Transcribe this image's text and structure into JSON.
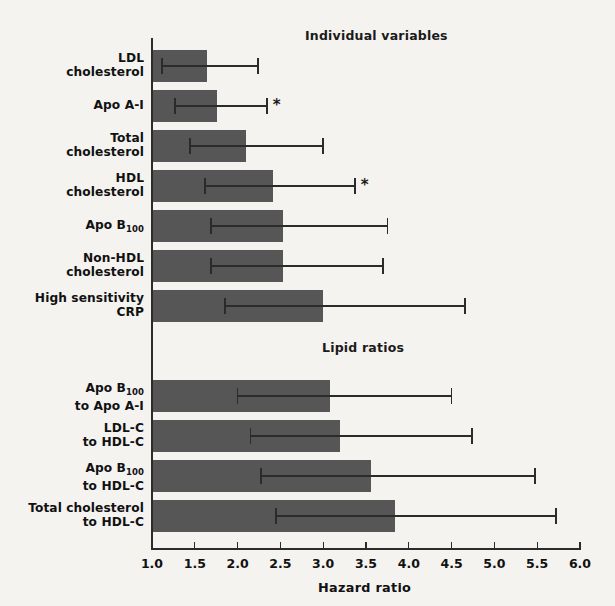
{
  "figure": {
    "section_titles": {
      "individual": "Individual variables",
      "ratios": "Lipid  ratios"
    },
    "axis_title": "Hazard ratio",
    "footnote_marker": "*",
    "colors": {
      "bar_fill": "#565656",
      "axis": "#2b2b2b",
      "background": "#f4f3f0",
      "text": "#111111"
    }
  },
  "chart_data": {
    "type": "bar",
    "orientation": "horizontal",
    "title": "",
    "xlabel": "Hazard ratio",
    "ylabel": "",
    "xlim": [
      1.0,
      6.0
    ],
    "xticks": [
      1.0,
      1.5,
      2.0,
      2.5,
      3.0,
      3.5,
      4.0,
      4.5,
      5.0,
      5.5,
      6.0
    ],
    "xticklabels": [
      "1.0",
      "1.5",
      "2.0",
      "2.5",
      "3.0",
      "3.5",
      "4.0",
      "4.5",
      "5.0",
      "5.5",
      "6.0"
    ],
    "grid": false,
    "legend": null,
    "error_bars": "95% confidence interval",
    "groups": [
      {
        "name": "Individual variables",
        "categories": [
          {
            "label": "LDL cholesterol",
            "label_lines": [
              "LDL",
              "cholesterol"
            ],
            "value": 1.64,
            "ci_low": 1.12,
            "ci_high": 2.24,
            "significant_marker": ""
          },
          {
            "label": "Apo A-I",
            "label_lines": [
              "Apo A-I"
            ],
            "value": 1.76,
            "ci_low": 1.27,
            "ci_high": 2.34,
            "significant_marker": "*"
          },
          {
            "label": "Total cholesterol",
            "label_lines": [
              "Total",
              "cholesterol"
            ],
            "value": 2.1,
            "ci_low": 1.44,
            "ci_high": 3.0,
            "significant_marker": ""
          },
          {
            "label": "HDL cholesterol",
            "label_lines": [
              "HDL",
              "cholesterol"
            ],
            "value": 2.41,
            "ci_low": 1.62,
            "ci_high": 3.37,
            "significant_marker": "*"
          },
          {
            "label": "Apo B100",
            "label_lines": [
              "Apo B<sub>100</sub>"
            ],
            "value": 2.53,
            "ci_low": 1.69,
            "ci_high": 3.75,
            "significant_marker": ""
          },
          {
            "label": "Non-HDL cholesterol",
            "label_lines": [
              "Non-HDL",
              "cholesterol"
            ],
            "value": 2.53,
            "ci_low": 1.69,
            "ci_high": 3.7,
            "significant_marker": ""
          },
          {
            "label": "High sensitivity CRP",
            "label_lines": [
              "High sensitivity",
              "CRP"
            ],
            "value": 3.0,
            "ci_low": 1.85,
            "ci_high": 4.66,
            "significant_marker": ""
          }
        ]
      },
      {
        "name": "Lipid ratios",
        "categories": [
          {
            "label": "Apo B100 to Apo A-I",
            "label_lines": [
              "Apo B<sub>100</sub>",
              "to Apo A-I"
            ],
            "value": 3.08,
            "ci_low": 2.0,
            "ci_high": 4.5,
            "significant_marker": ""
          },
          {
            "label": "LDL-C to HDL-C",
            "label_lines": [
              "LDL-C",
              "to HDL-C"
            ],
            "value": 3.2,
            "ci_low": 2.15,
            "ci_high": 4.74,
            "significant_marker": ""
          },
          {
            "label": "Apo B100 to HDL-C",
            "label_lines": [
              "Apo B<sub>100</sub>",
              "to HDL-C"
            ],
            "value": 3.56,
            "ci_low": 2.27,
            "ci_high": 5.47,
            "significant_marker": ""
          },
          {
            "label": "Total cholesterol to HDL-C",
            "label_lines": [
              "Total cholesterol",
              "to HDL-C"
            ],
            "value": 3.84,
            "ci_low": 2.45,
            "ci_high": 5.72,
            "significant_marker": ""
          }
        ]
      }
    ]
  }
}
